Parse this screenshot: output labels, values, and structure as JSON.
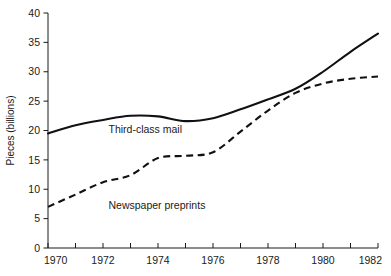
{
  "chart_data": {
    "type": "line",
    "title": "",
    "xlabel": "",
    "ylabel": "Pieces (billions)",
    "xlim": [
      1970,
      1982
    ],
    "ylim": [
      0,
      40
    ],
    "grid": false,
    "legend_position": "inline-annotation",
    "x": [
      1970,
      1971,
      1972,
      1973,
      1974,
      1975,
      1976,
      1977,
      1978,
      1979,
      1980,
      1981,
      1982
    ],
    "x_tick_labels": [
      "1970",
      "1972",
      "1974",
      "1976",
      "1978",
      "1980",
      "1982"
    ],
    "x_tick_values": [
      1970,
      1972,
      1974,
      1976,
      1978,
      1980,
      1982
    ],
    "x_minor_tick_values": [
      1971,
      1973,
      1975,
      1977,
      1979,
      1981
    ],
    "y_tick_labels": [
      "0",
      "5",
      "10",
      "15",
      "20",
      "25",
      "30",
      "35",
      "40"
    ],
    "y_tick_values": [
      0,
      5,
      10,
      15,
      20,
      25,
      30,
      35,
      40
    ],
    "series": [
      {
        "name": "Third-class mail",
        "style": "solid",
        "color": "#111111",
        "values": [
          19.5,
          20.9,
          21.8,
          22.5,
          22.4,
          21.6,
          22.1,
          23.6,
          25.3,
          27.1,
          30.0,
          33.4,
          36.5
        ]
      },
      {
        "name": "Newspaper preprints",
        "style": "dashed",
        "color": "#111111",
        "values": [
          7.0,
          9.1,
          11.2,
          12.4,
          15.3,
          15.7,
          16.3,
          19.8,
          23.4,
          26.4,
          28.0,
          28.8,
          29.2
        ]
      }
    ],
    "annotations": [
      {
        "text": "Third-class mail",
        "x": 1972.2,
        "y": 19.6
      },
      {
        "text": "Newspaper preprints",
        "x": 1972.2,
        "y": 6.6
      }
    ]
  }
}
